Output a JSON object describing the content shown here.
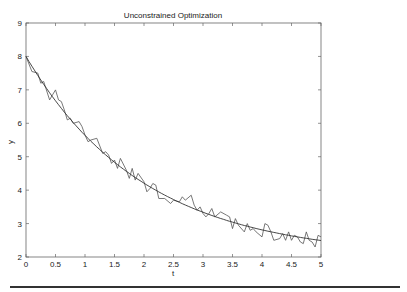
{
  "chart_data": {
    "type": "line",
    "title": "Unconstrained Optimization",
    "xlabel": "t",
    "ylabel": "y",
    "xlim": [
      0,
      5
    ],
    "ylim": [
      2,
      9
    ],
    "xticks": [
      0,
      0.5,
      1,
      1.5,
      2,
      2.5,
      3,
      3.5,
      4,
      4.5,
      5
    ],
    "xtick_labels": [
      "0",
      "0.5",
      "1",
      "1.5",
      "2",
      "2.5",
      "3",
      "3.5",
      "4",
      "4.5",
      "5"
    ],
    "yticks": [
      2,
      3,
      4,
      5,
      6,
      7,
      8,
      9
    ],
    "ytick_labels": [
      "2",
      "3",
      "4",
      "5",
      "6",
      "7",
      "8",
      "9"
    ],
    "grid": false,
    "legend": null,
    "series": [
      {
        "name": "noisy data",
        "x": [
          0,
          0.1,
          0.2,
          0.25,
          0.3,
          0.4,
          0.45,
          0.5,
          0.55,
          0.6,
          0.65,
          0.7,
          0.75,
          0.8,
          0.9,
          0.95,
          1.0,
          1.05,
          1.1,
          1.2,
          1.3,
          1.35,
          1.4,
          1.45,
          1.5,
          1.55,
          1.6,
          1.7,
          1.75,
          1.8,
          1.85,
          1.9,
          2.0,
          2.05,
          2.1,
          2.15,
          2.2,
          2.25,
          2.35,
          2.45,
          2.5,
          2.6,
          2.65,
          2.7,
          2.8,
          2.85,
          2.9,
          2.95,
          3.0,
          3.05,
          3.1,
          3.15,
          3.2,
          3.3,
          3.4,
          3.45,
          3.5,
          3.55,
          3.6,
          3.7,
          3.75,
          3.8,
          3.85,
          3.9,
          4.0,
          4.05,
          4.1,
          4.15,
          4.2,
          4.3,
          4.35,
          4.4,
          4.45,
          4.5,
          4.55,
          4.6,
          4.65,
          4.7,
          4.75,
          4.8,
          4.85,
          4.9,
          4.95,
          5.0
        ],
        "y": [
          8.0,
          7.55,
          7.5,
          7.2,
          7.25,
          6.7,
          6.85,
          7.0,
          6.7,
          6.65,
          6.4,
          6.1,
          6.15,
          6.0,
          6.05,
          5.9,
          5.65,
          5.45,
          5.5,
          5.55,
          5.1,
          5.15,
          5.05,
          4.8,
          4.9,
          4.65,
          4.95,
          4.6,
          4.35,
          4.65,
          4.3,
          4.5,
          4.25,
          3.95,
          4.05,
          4.2,
          4.15,
          3.75,
          3.75,
          3.6,
          3.7,
          3.65,
          3.8,
          3.7,
          3.85,
          3.55,
          3.4,
          3.5,
          3.3,
          3.2,
          3.3,
          3.45,
          3.2,
          3.35,
          3.25,
          3.2,
          2.85,
          3.15,
          2.95,
          2.75,
          3.0,
          2.8,
          2.85,
          2.75,
          2.6,
          3.0,
          2.95,
          2.75,
          2.5,
          2.55,
          2.7,
          2.5,
          2.75,
          2.5,
          2.65,
          2.6,
          2.45,
          2.4,
          2.75,
          2.5,
          2.45,
          2.3,
          2.65,
          2.6
        ]
      },
      {
        "name": "fitted curve",
        "model": "y = 2 + 6*exp(-0.5*t)",
        "x": [
          0,
          0.25,
          0.5,
          0.75,
          1,
          1.25,
          1.5,
          1.75,
          2,
          2.25,
          2.5,
          2.75,
          3,
          3.25,
          3.5,
          3.75,
          4,
          4.25,
          4.5,
          4.75,
          5
        ],
        "y": [
          8.0,
          7.29,
          6.67,
          6.13,
          5.64,
          5.21,
          4.83,
          4.5,
          4.21,
          3.95,
          3.72,
          3.52,
          3.34,
          3.18,
          3.04,
          2.92,
          2.81,
          2.72,
          2.63,
          2.56,
          2.49
        ]
      }
    ]
  },
  "colors": {
    "line": "#444444",
    "axes": "#555555",
    "rule": "#333333"
  }
}
